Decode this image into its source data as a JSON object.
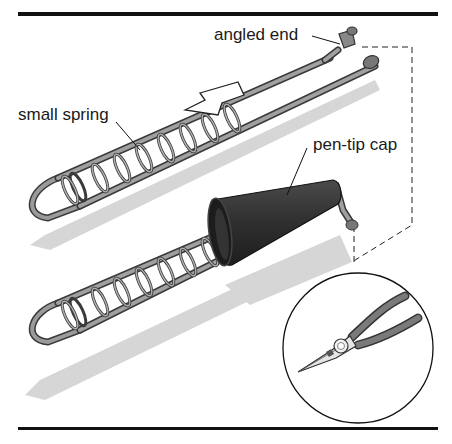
{
  "figure": {
    "labels": {
      "angled_end": "angled end",
      "small_spring": "small spring",
      "pen_tip_cap": "pen-tip cap"
    },
    "inset": {
      "tool": "needle-nose pliers"
    },
    "colors": {
      "rule": "#111111",
      "wire": "#8f8f8f",
      "wire_dark": "#3a3a3a",
      "shadow": "#d4d4d4",
      "cap": "#2e2e2e",
      "plier_handle": "#7a7a7a"
    }
  }
}
